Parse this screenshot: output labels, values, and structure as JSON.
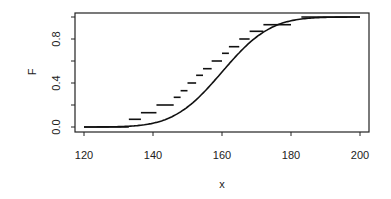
{
  "chart_data": {
    "type": "line",
    "title": "",
    "xlabel": "x",
    "ylabel": "F",
    "xlim": [
      120,
      200
    ],
    "ylim": [
      0,
      1
    ],
    "x_ticks": [
      120,
      140,
      160,
      180,
      200
    ],
    "x_tick_labels": [
      "120",
      "140",
      "160",
      "180",
      "200"
    ],
    "y_ticks": [
      0.0,
      0.2,
      0.4,
      0.6,
      0.8,
      1.0
    ],
    "y_tick_labels": [
      "0.0",
      "0.4",
      "0.8"
    ],
    "grid": false,
    "legend": null,
    "series": [
      {
        "name": "empirical CDF (steps)",
        "kind": "step-segments",
        "segments": [
          {
            "x0": 120,
            "x1": 133,
            "y": 0.0
          },
          {
            "x0": 133,
            "x1": 136.5,
            "y": 0.07
          },
          {
            "x0": 136.5,
            "x1": 141,
            "y": 0.13
          },
          {
            "x0": 141,
            "x1": 146,
            "y": 0.2
          },
          {
            "x0": 146,
            "x1": 148,
            "y": 0.27
          },
          {
            "x0": 148,
            "x1": 150,
            "y": 0.33
          },
          {
            "x0": 150,
            "x1": 152.5,
            "y": 0.4
          },
          {
            "x0": 152.5,
            "x1": 154.5,
            "y": 0.47
          },
          {
            "x0": 154.5,
            "x1": 157,
            "y": 0.53
          },
          {
            "x0": 157,
            "x1": 160,
            "y": 0.6
          },
          {
            "x0": 160,
            "x1": 162,
            "y": 0.67
          },
          {
            "x0": 162,
            "x1": 165,
            "y": 0.73
          },
          {
            "x0": 165,
            "x1": 168,
            "y": 0.8
          },
          {
            "x0": 168,
            "x1": 172,
            "y": 0.87
          },
          {
            "x0": 172,
            "x1": 180,
            "y": 0.93
          },
          {
            "x0": 183,
            "x1": 200,
            "y": 1.0
          }
        ]
      },
      {
        "name": "normal CDF",
        "kind": "smooth-curve",
        "mean": 160,
        "sd": 11,
        "x": [
          120,
          130,
          135,
          140,
          145,
          150,
          155,
          160,
          165,
          170,
          175,
          180,
          185,
          190,
          200
        ],
        "values": [
          0.0,
          0.003,
          0.012,
          0.035,
          0.087,
          0.18,
          0.325,
          0.5,
          0.675,
          0.82,
          0.913,
          0.965,
          0.988,
          0.997,
          1.0
        ]
      }
    ]
  }
}
